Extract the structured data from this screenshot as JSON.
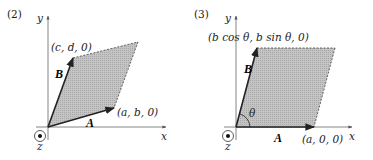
{
  "panels": [
    {
      "id": "2",
      "label": "(2)",
      "axes": {
        "x": "x",
        "y": "y",
        "z": "z"
      },
      "vectors": {
        "A": "A",
        "B": "B"
      },
      "points": {
        "A_tip": "(a, b, 0)",
        "B_tip": "(c, d, 0)"
      },
      "shape": "parallelogram spanned by A and B"
    },
    {
      "id": "3",
      "label": "(3)",
      "axes": {
        "x": "x",
        "y": "y",
        "z": "z"
      },
      "vectors": {
        "A": "A",
        "B": "B"
      },
      "angle": "θ",
      "points": {
        "A_tip": "(a, 0, 0)",
        "B_tip": "(b cos θ, b sin θ, 0)"
      },
      "shape": "parallelogram spanned by A and B"
    }
  ],
  "colors": {
    "fill": "#b8b8b8",
    "stroke": "#222222",
    "axis": "#666666"
  }
}
